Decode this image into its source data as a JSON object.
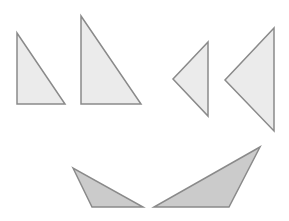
{
  "canvas": {
    "width": 289,
    "height": 221,
    "background": "#ffffff"
  },
  "colors": {
    "light_fill": "#ebebeb",
    "dark_fill": "#cbcbcb",
    "stroke": "#8a8a8a"
  },
  "shapes": [
    {
      "name": "right-triangle-small",
      "points": "17,33 17,104 65,104",
      "fill": "light"
    },
    {
      "name": "right-triangle-large",
      "points": "81,16 81,104 141,104",
      "fill": "light"
    },
    {
      "name": "left-pointing-triangle-small",
      "points": "208,42 173,79 208,116",
      "fill": "light"
    },
    {
      "name": "left-pointing-triangle-large",
      "points": "274,28 225,80 274,131",
      "fill": "light"
    },
    {
      "name": "obtuse-triangle-left",
      "points": "73,168 92,207 143,207",
      "fill": "dark"
    },
    {
      "name": "obtuse-triangle-right",
      "points": "154,207 229,207 260,147",
      "fill": "dark"
    }
  ]
}
